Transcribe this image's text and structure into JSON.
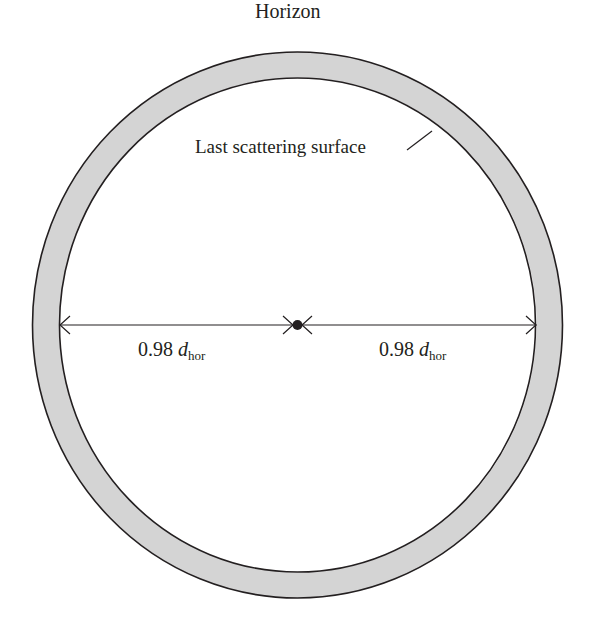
{
  "diagram": {
    "title": "Horizon",
    "ring_label": "Last scattering surface",
    "left_distance": {
      "coefficient": "0.98",
      "symbol": "d",
      "subscript": "hor"
    },
    "right_distance": {
      "coefficient": "0.98",
      "symbol": "d",
      "subscript": "hor"
    },
    "colors": {
      "ring_fill": "#d4d4d4",
      "stroke": "#231f20",
      "background": "#ffffff"
    }
  }
}
